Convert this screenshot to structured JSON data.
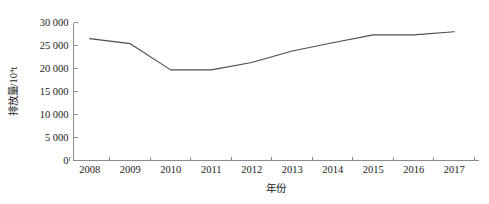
{
  "chart_data": {
    "type": "line",
    "title": "",
    "xlabel": "年份",
    "ylabel": "排放量/10⁴t",
    "ylabel_base": "排放量/10",
    "ylabel_exp": "4",
    "ylabel_unit": "t",
    "categories": [
      "2008",
      "2009",
      "2010",
      "2011",
      "2012",
      "2013",
      "2014",
      "2015",
      "2016",
      "2017"
    ],
    "x": [
      2008,
      2009,
      2010,
      2011,
      2012,
      2013,
      2014,
      2015,
      2016,
      2017
    ],
    "values": [
      26500,
      25400,
      19700,
      19700,
      21300,
      23800,
      25600,
      27300,
      27300,
      28000
    ],
    "series": [
      {
        "name": "排放量",
        "values": [
          26500,
          25400,
          19700,
          19700,
          21300,
          23800,
          25600,
          27300,
          27300,
          28000
        ]
      }
    ],
    "ylim": [
      0,
      30000
    ],
    "ytick_values": [
      0,
      5000,
      10000,
      15000,
      20000,
      25000,
      30000
    ],
    "ytick_labels": [
      "0",
      "5 000",
      "10 000",
      "15 000",
      "20 000",
      "25 000",
      "30 000"
    ],
    "xlim": [
      2007.6,
      2017.6
    ],
    "grid": false,
    "legend": null,
    "legend_position": "none",
    "line_color": "#4d4d4d",
    "axis_color": "#8c8c8c",
    "text_color": "#1a1a1a",
    "background_color": "#ffffff"
  }
}
